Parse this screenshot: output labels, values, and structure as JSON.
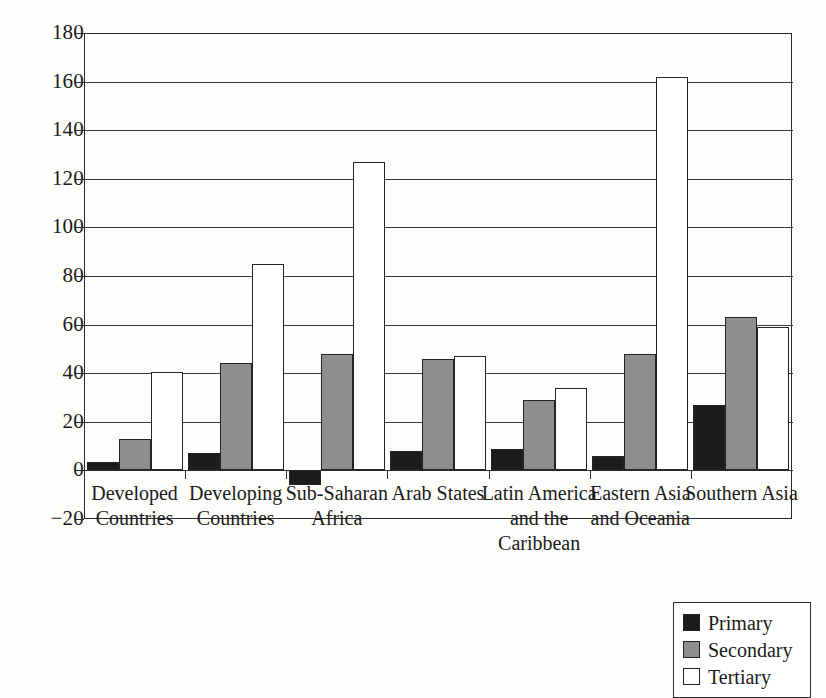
{
  "chart_data": {
    "type": "bar",
    "title": "",
    "subtitle": "",
    "xlabel": "",
    "ylabel": "",
    "ylim": [
      -20,
      180
    ],
    "ytick_values": [
      180,
      160,
      140,
      120,
      100,
      80,
      60,
      40,
      20,
      0,
      -20
    ],
    "ytick_labels": [
      "180",
      "160",
      "140",
      "120",
      "100",
      "80",
      "60",
      "40",
      "20",
      "0",
      "−20"
    ],
    "grid": "horizontal",
    "grid_values": [
      180,
      160,
      140,
      120,
      100,
      80,
      60,
      40,
      20,
      0
    ],
    "legend_position": "bottom-right",
    "categories": [
      "Developed\nCountries",
      "Developing\nCountries",
      "Sub-Saharan\nAfrica",
      "Arab States",
      "Latin America\nand the\nCaribbean",
      "Eastern Asia\nand Oceania",
      "Southern Asia"
    ],
    "category_lines": [
      [
        "Developed",
        "Countries"
      ],
      [
        "Developing",
        "Countries"
      ],
      [
        "Sub-Saharan",
        "Africa"
      ],
      [
        "Arab States"
      ],
      [
        "Latin America",
        "and the",
        "Caribbean"
      ],
      [
        "Eastern Asia",
        "and Oceania"
      ],
      [
        "Southern Asia"
      ]
    ],
    "series": [
      {
        "name": "Primary",
        "color": "#1c1c1c",
        "values": [
          3.5,
          7,
          -6,
          8,
          9,
          6,
          27
        ]
      },
      {
        "name": "Secondary",
        "color": "#8e8e8e",
        "values": [
          13,
          44,
          48,
          46,
          29,
          48,
          63
        ]
      },
      {
        "name": "Tertiary",
        "color": "#ffffff",
        "values": [
          40.5,
          85,
          127,
          47,
          34,
          162,
          59
        ]
      }
    ]
  },
  "legend": {
    "items": [
      {
        "label": "Primary",
        "swatch": "primary"
      },
      {
        "label": "Secondary",
        "swatch": "secondary"
      },
      {
        "label": "Tertiary",
        "swatch": "tertiary"
      }
    ]
  }
}
